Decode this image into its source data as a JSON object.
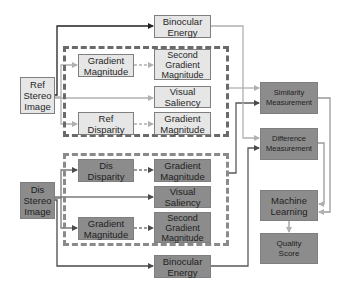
{
  "diagram": {
    "colors": {
      "ref_box_fill": "#e6e6e6",
      "dis_box_fill": "#8c8c8c",
      "border": "#7f7f7f",
      "ref_arrow": "#b0b0b0",
      "dis_arrow": "#5a5a5a",
      "dashed_outline": "#5a5a5a"
    },
    "ref_branch": {
      "input": "Ref\nStereo\nImage",
      "binocular_energy": "Binocular\nEnergy",
      "gradient_magnitude": "Gradient\nMagnitude",
      "second_gradient_magnitude": "Second\nGradient\nMagnitude",
      "visual_saliency": "Visual\nSaliency",
      "disparity": "Ref\nDisparity",
      "disparity_gradient_magnitude": "Gradient\nMagnitude"
    },
    "dis_branch": {
      "input": "Dis\nStereo\nImage",
      "disparity": "Dis\nDisparity",
      "disparity_gradient_magnitude": "Gradient\nMagnitude",
      "visual_saliency": "Visual\nSaliency",
      "gradient_magnitude": "Gradient\nMagnitude",
      "second_gradient_magnitude": "Second\nGradient\nMagnitude",
      "binocular_energy": "Binocular\nEnergy"
    },
    "output": {
      "similarity_measurement": "Similarity\nMeasurement",
      "difference_measurement": "Difference\nMeasurement",
      "machine_learning": "Machine\nLearning",
      "quality_score": "Quality\nScore"
    }
  }
}
